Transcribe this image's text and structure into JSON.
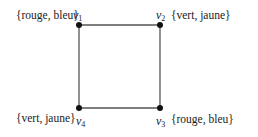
{
  "diagram": {
    "type": "graph",
    "vertices": [
      {
        "id": "v1",
        "name": "v",
        "sub": "1",
        "label": "{rouge, bleu}",
        "x": 79,
        "y": 25
      },
      {
        "id": "v2",
        "name": "v",
        "sub": "2",
        "label": "{vert, jaune}",
        "x": 160,
        "y": 25
      },
      {
        "id": "v3",
        "name": "v",
        "sub": "3",
        "label": "{rouge, bleu}",
        "x": 160,
        "y": 108
      },
      {
        "id": "v4",
        "name": "v",
        "sub": "4",
        "label": "{vert, jaune}",
        "x": 79,
        "y": 108
      }
    ],
    "edges": [
      [
        "v1",
        "v2"
      ],
      [
        "v2",
        "v3"
      ],
      [
        "v3",
        "v4"
      ],
      [
        "v4",
        "v1"
      ]
    ],
    "colors": {
      "edge": "#555555",
      "vertex": "#111111",
      "text": "#222222"
    }
  }
}
